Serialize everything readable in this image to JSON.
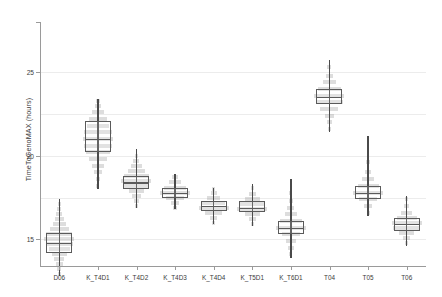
{
  "chart_data": {
    "type": "box",
    "title": "",
    "xlabel": "",
    "ylabel": "TimeToGenoMAX  (hours)",
    "ylim": [
      13.4,
      28.0
    ],
    "yticks": [
      15,
      20,
      25
    ],
    "ytick_labels": [
      "15",
      "20",
      "25"
    ],
    "gridlines": [
      15,
      17.5,
      20,
      22.5,
      25
    ],
    "grid": true,
    "legend": "none",
    "categories": [
      "D06",
      "K_T4D1",
      "K_T4D2",
      "K_T4D3",
      "K_T4D4",
      "K_T5D1",
      "K_T6D1",
      "T04",
      "T05",
      "T06"
    ],
    "series": [
      {
        "name": "TimeToGenoMAX distribution",
        "boxes": [
          {
            "category": "D06",
            "whisker_low": 12.8,
            "q1": 14.2,
            "median": 14.8,
            "q3": 15.4,
            "whisker_high": 17.4,
            "density": [
              {
                "v": 12.9,
                "w": 0.1
              },
              {
                "v": 13.2,
                "w": 0.14
              },
              {
                "v": 13.5,
                "w": 0.22
              },
              {
                "v": 13.8,
                "w": 0.34
              },
              {
                "v": 14.1,
                "w": 0.52
              },
              {
                "v": 14.4,
                "w": 0.72
              },
              {
                "v": 14.7,
                "w": 0.92
              },
              {
                "v": 15.0,
                "w": 1.0
              },
              {
                "v": 15.3,
                "w": 0.86
              },
              {
                "v": 15.6,
                "w": 0.62
              },
              {
                "v": 15.9,
                "w": 0.44
              },
              {
                "v": 16.2,
                "w": 0.3
              },
              {
                "v": 16.5,
                "w": 0.2
              },
              {
                "v": 16.8,
                "w": 0.13
              },
              {
                "v": 17.1,
                "w": 0.09
              }
            ]
          },
          {
            "category": "K_T4D1",
            "whisker_low": 18.0,
            "q1": 20.2,
            "median": 21.0,
            "q3": 22.1,
            "whisker_high": 23.4,
            "density": [
              {
                "v": 18.2,
                "w": 0.1
              },
              {
                "v": 18.6,
                "w": 0.16
              },
              {
                "v": 19.0,
                "w": 0.26
              },
              {
                "v": 19.4,
                "w": 0.4
              },
              {
                "v": 19.8,
                "w": 0.58
              },
              {
                "v": 20.2,
                "w": 0.8
              },
              {
                "v": 20.6,
                "w": 0.96
              },
              {
                "v": 21.0,
                "w": 1.0
              },
              {
                "v": 21.4,
                "w": 0.92
              },
              {
                "v": 21.8,
                "w": 0.76
              },
              {
                "v": 22.2,
                "w": 0.58
              },
              {
                "v": 22.6,
                "w": 0.38
              },
              {
                "v": 23.0,
                "w": 0.22
              },
              {
                "v": 23.3,
                "w": 0.12
              }
            ]
          },
          {
            "category": "K_T4D2",
            "whisker_low": 16.9,
            "q1": 18.0,
            "median": 18.4,
            "q3": 18.8,
            "whisker_high": 20.4,
            "density": [
              {
                "v": 17.0,
                "w": 0.1
              },
              {
                "v": 17.3,
                "w": 0.18
              },
              {
                "v": 17.6,
                "w": 0.32
              },
              {
                "v": 17.9,
                "w": 0.52
              },
              {
                "v": 18.2,
                "w": 0.8
              },
              {
                "v": 18.5,
                "w": 1.0
              },
              {
                "v": 18.8,
                "w": 0.82
              },
              {
                "v": 19.1,
                "w": 0.56
              },
              {
                "v": 19.4,
                "w": 0.34
              },
              {
                "v": 19.7,
                "w": 0.2
              },
              {
                "v": 20.0,
                "w": 0.12
              }
            ]
          },
          {
            "category": "K_T4D3",
            "whisker_low": 16.8,
            "q1": 17.5,
            "median": 17.8,
            "q3": 18.1,
            "whisker_high": 18.9,
            "density": [
              {
                "v": 16.9,
                "w": 0.12
              },
              {
                "v": 17.2,
                "w": 0.26
              },
              {
                "v": 17.5,
                "w": 0.58
              },
              {
                "v": 17.8,
                "w": 1.0
              },
              {
                "v": 18.1,
                "w": 0.74
              },
              {
                "v": 18.4,
                "w": 0.4
              },
              {
                "v": 18.7,
                "w": 0.18
              }
            ]
          },
          {
            "category": "K_T4D4",
            "whisker_low": 15.9,
            "q1": 16.7,
            "median": 17.0,
            "q3": 17.3,
            "whisker_high": 18.1,
            "density": [
              {
                "v": 16.0,
                "w": 0.1
              },
              {
                "v": 16.3,
                "w": 0.24
              },
              {
                "v": 16.6,
                "w": 0.56
              },
              {
                "v": 16.9,
                "w": 1.0
              },
              {
                "v": 17.2,
                "w": 0.78
              },
              {
                "v": 17.5,
                "w": 0.44
              },
              {
                "v": 17.8,
                "w": 0.2
              },
              {
                "v": 18.0,
                "w": 0.11
              }
            ]
          },
          {
            "category": "K_T5D1",
            "whisker_low": 15.8,
            "q1": 16.6,
            "median": 16.9,
            "q3": 17.3,
            "whisker_high": 18.3,
            "density": [
              {
                "v": 15.9,
                "w": 0.1
              },
              {
                "v": 16.2,
                "w": 0.22
              },
              {
                "v": 16.5,
                "w": 0.5
              },
              {
                "v": 16.8,
                "w": 1.0
              },
              {
                "v": 17.1,
                "w": 0.82
              },
              {
                "v": 17.4,
                "w": 0.48
              },
              {
                "v": 17.7,
                "w": 0.24
              },
              {
                "v": 18.1,
                "w": 0.12
              }
            ]
          },
          {
            "category": "K_T6D1",
            "whisker_low": 13.9,
            "q1": 15.3,
            "median": 15.7,
            "q3": 16.1,
            "whisker_high": 18.6,
            "density": [
              {
                "v": 14.1,
                "w": 0.1
              },
              {
                "v": 14.5,
                "w": 0.18
              },
              {
                "v": 14.9,
                "w": 0.34
              },
              {
                "v": 15.3,
                "w": 0.62
              },
              {
                "v": 15.7,
                "w": 1.0
              },
              {
                "v": 16.1,
                "w": 0.72
              },
              {
                "v": 16.5,
                "w": 0.42
              },
              {
                "v": 16.9,
                "w": 0.24
              },
              {
                "v": 17.3,
                "w": 0.14
              },
              {
                "v": 17.8,
                "w": 0.09
              }
            ]
          },
          {
            "category": "T04",
            "whisker_low": 21.4,
            "q1": 23.1,
            "median": 23.5,
            "q3": 24.0,
            "whisker_high": 25.7,
            "density": [
              {
                "v": 21.6,
                "w": 0.1
              },
              {
                "v": 22.0,
                "w": 0.18
              },
              {
                "v": 22.4,
                "w": 0.32
              },
              {
                "v": 22.8,
                "w": 0.6
              },
              {
                "v": 23.2,
                "w": 0.92
              },
              {
                "v": 23.6,
                "w": 1.0
              },
              {
                "v": 24.0,
                "w": 0.74
              },
              {
                "v": 24.4,
                "w": 0.46
              },
              {
                "v": 24.8,
                "w": 0.26
              },
              {
                "v": 25.3,
                "w": 0.13
              }
            ]
          },
          {
            "category": "T05",
            "whisker_low": 16.4,
            "q1": 17.4,
            "median": 17.8,
            "q3": 18.2,
            "whisker_high": 21.2,
            "density": [
              {
                "v": 16.6,
                "w": 0.1
              },
              {
                "v": 17.0,
                "w": 0.26
              },
              {
                "v": 17.4,
                "w": 0.62
              },
              {
                "v": 17.8,
                "w": 1.0
              },
              {
                "v": 18.2,
                "w": 0.7
              },
              {
                "v": 18.6,
                "w": 0.4
              },
              {
                "v": 19.0,
                "w": 0.22
              },
              {
                "v": 19.6,
                "w": 0.12
              }
            ]
          },
          {
            "category": "T06",
            "whisker_low": 14.6,
            "q1": 15.5,
            "median": 15.9,
            "q3": 16.3,
            "whisker_high": 17.6,
            "density": [
              {
                "v": 14.8,
                "w": 0.1
              },
              {
                "v": 15.1,
                "w": 0.22
              },
              {
                "v": 15.4,
                "w": 0.5
              },
              {
                "v": 15.7,
                "w": 0.92
              },
              {
                "v": 16.0,
                "w": 1.0
              },
              {
                "v": 16.3,
                "w": 0.66
              },
              {
                "v": 16.6,
                "w": 0.36
              },
              {
                "v": 17.0,
                "w": 0.18
              },
              {
                "v": 17.4,
                "w": 0.1
              }
            ]
          }
        ]
      }
    ],
    "colors": {
      "box_stroke": "#5a5a5a",
      "whisker": "#4a4a4a",
      "density_fill": "#8d8d8d",
      "grid": "#ececec",
      "axis": "#9a9a9a",
      "text": "#3b3b3b"
    }
  }
}
